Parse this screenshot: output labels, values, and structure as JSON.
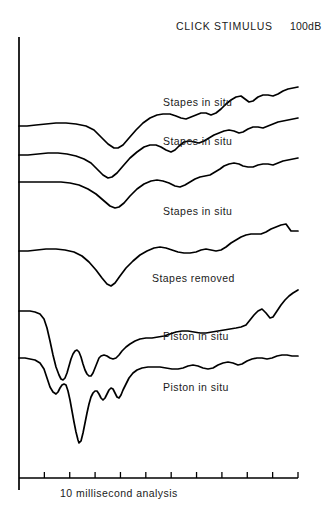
{
  "header": {
    "title": "CLICK STIMULUS",
    "level": "100dB"
  },
  "axis": {
    "caption": "10 millisecond analysis",
    "vertical": {
      "x": 19,
      "y_top": 37,
      "y_bottom": 490
    },
    "horizontal": {
      "y": 478,
      "x_start": 19,
      "x_end": 298
    },
    "tick_count": 11,
    "tick_length": 6
  },
  "labels": [
    {
      "text": "Stapes in situ",
      "x": 163,
      "y": 96
    },
    {
      "text": "Stapes in situ",
      "x": 163,
      "y": 135
    },
    {
      "text": "Stapes in situ",
      "x": 163,
      "y": 205
    },
    {
      "text": "Stapes removed",
      "x": 152,
      "y": 272
    },
    {
      "text": "Piston in situ",
      "x": 163,
      "y": 330
    },
    {
      "text": "Piston in situ",
      "x": 163,
      "y": 381
    }
  ],
  "chart_data": {
    "type": "line",
    "title": "CLICK STIMULUS",
    "subtitle": "100dB",
    "xlabel": "10 millisecond analysis",
    "ylabel": "",
    "xlim": [
      0,
      10
    ],
    "ylim": [
      0,
      518
    ],
    "grid": false,
    "legend": "inline-annotations",
    "x_units": "milliseconds",
    "series": [
      {
        "name": "Stapes in situ (1)",
        "label": "Stapes in situ",
        "points": "19,126 27,126 36,125 46,124 56,123 66,123 76,124 86,126 94,130 101,137 108,144 114,148 118,148 123,145 129,138 136,130 143,123 150,118 157,115 163,114 170,114 176,116 181,118 186,119 191,117 196,115 201,113 206,113 211,115 216,113 221,109 226,104 231,100 236,97 241,96 245,99 249,102 253,101 258,97 263,95 268,95 273,96 278,94 283,91 288,89 293,88 298,87"
      },
      {
        "name": "Stapes in situ (2)",
        "label": "Stapes in situ",
        "points": "19,155 28,155 38,154 48,153 58,153 67,154 76,156 84,159 91,163 97,169 103,175 108,178 112,177 117,173 123,166 130,158 137,152 144,147 150,145 156,145 161,147 166,150 171,152 175,150 179,146 184,142 189,141 194,142 199,143 204,141 209,138 214,135 219,133 224,131 229,130 234,131 239,133 243,132 248,129 253,127 258,127 263,128 268,126 273,124 278,122 283,121 288,120 293,119 298,118"
      },
      {
        "name": "Stapes in situ (3)",
        "label": "Stapes in situ",
        "points": "19,182 29,182 40,182 51,182 61,182 70,183 79,185 88,189 96,194 103,200 110,206 115,208 119,207 124,203 130,196 137,189 144,184 151,181 157,180 163,181 169,183 175,186 180,187 185,185 190,182 195,179 200,177 205,176 210,175 215,172 220,169 224,166 229,164 234,163 239,164 243,166 248,167 253,167 258,165 263,164 268,164 273,165 278,163 283,161 288,160 293,159 298,158"
      },
      {
        "name": "Stapes removed",
        "label": "Stapes removed",
        "points": "19,251 28,251 37,250 46,249 56,249 65,250 74,252 82,256 89,262 96,270 102,278 107,284 111,286 115,283 120,276 126,268 133,261 140,255 147,251 154,248 160,247 166,248 172,250 178,252 184,253 190,253 196,252 201,250 206,249 211,250 216,251 221,250 226,247 231,243 236,240 241,237 246,235 251,234 256,234 261,234 266,232 271,229 276,227 281,225 286,224 291,231 298,231"
      },
      {
        "name": "Piston in situ (1)",
        "label": "Piston in situ",
        "points": "19,311 25,311 30,311 35,312 40,314 44,319 47,328 50,341 53,355 56,367 59,375 61,379 63,380 65,378 67,373 69,366 71,359 73,354 75,351 77,350 79,352 81,357 83,364 85,370 87,374 89,376 91,376 93,373 95,368 97,363 99,358 101,356 104,355 107,356 110,358 113,359 116,358 119,355 122,351 126,347 130,344 135,341 140,339 146,338 152,338 158,337 164,336 170,334 176,332 182,331 188,331 194,332 200,333 206,333 212,332 218,331 224,330 230,329 236,328 241,327 246,325 250,320 254,315 258,311 262,309 266,313 270,318 273,317 277,311 281,305 285,300 289,296 293,293 298,290"
      },
      {
        "name": "Piston in situ (2)",
        "label": "Piston in situ",
        "points": "19,358 25,358 30,359 35,360 40,363 44,369 47,378 50,387 53,392 56,394 58,392 60,388 62,385 64,384 66,385 68,391 70,400 72,411 74,422 76,432 78,440 79,443 81,441 83,433 85,423 87,413 89,404 91,397 93,393 95,391 97,391 99,394 101,398 103,400 105,398 107,394 109,390 111,388 113,389 115,393 117,397 119,398 121,395 123,390 126,384 129,378 133,373 137,370 142,368 148,367 154,367 160,367 166,368 172,369 178,369 183,368 188,366 193,365 198,366 203,368 208,369 213,368 218,365 223,363 228,362 233,363 238,365 242,364 247,361 252,359 257,358 262,358 267,359 272,358 277,356 282,355 287,355 292,356 298,356"
      }
    ]
  }
}
